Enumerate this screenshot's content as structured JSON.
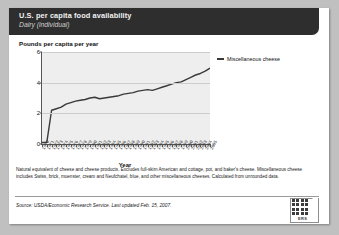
{
  "header": {
    "title": "U.S. per capita food availability",
    "subtitle": "Dairy (individual)"
  },
  "chart_data": {
    "type": "line",
    "title": "U.S. per capita food availability",
    "subtitle": "Dairy (individual)",
    "ylabel": "Pounds per capita per year",
    "xlabel": "Year",
    "ylim": [
      0,
      6
    ],
    "yticks": [
      0,
      2,
      4,
      6
    ],
    "grid": true,
    "legend_position": "right",
    "legend": [
      "Miscellaneous cheese"
    ],
    "categories": [
      "1970",
      "1971",
      "1972",
      "1973",
      "1974",
      "1975",
      "1976",
      "1977",
      "1978",
      "1979",
      "1980",
      "1981",
      "1982",
      "1983",
      "1984",
      "1985",
      "1986",
      "1987",
      "1988",
      "1989",
      "1990",
      "1991",
      "1992",
      "1993",
      "1994",
      "1995",
      "1996",
      "1997",
      "1998",
      "1999",
      "2000",
      "2001",
      "2002",
      "2003",
      "2004",
      "2005"
    ],
    "tick_labels": [
      "1970",
      "1971",
      "1972",
      "1973",
      "1974",
      "1975",
      "1976",
      "1977",
      "1978",
      "1979",
      "1980",
      "1981",
      "1982",
      "1983",
      "1984",
      "1985",
      "1986",
      "1987",
      "1988",
      "1989",
      "1990",
      "1991",
      "1992",
      "1993",
      "1994",
      "1995",
      "1996",
      "1997",
      "1998",
      "1999",
      "2000",
      "2001",
      "2002",
      "2003",
      "2004",
      "2005"
    ],
    "series": [
      {
        "name": "Miscellaneous cheese",
        "color": "#3a3a3a",
        "values": [
          0.1,
          0.1,
          2.2,
          2.3,
          2.4,
          2.6,
          2.7,
          2.8,
          2.85,
          2.9,
          3.0,
          3.05,
          2.95,
          3.0,
          3.05,
          3.1,
          3.15,
          3.25,
          3.3,
          3.35,
          3.45,
          3.5,
          3.55,
          3.5,
          3.6,
          3.7,
          3.8,
          3.9,
          4.0,
          4.05,
          4.2,
          4.35,
          4.5,
          4.6,
          4.75,
          4.95
        ]
      }
    ]
  },
  "footnote": "Natural equivalent of cheese and cheese products.  Excludes full-skim American and cottage, pot, and baker's cheese.  Miscellaneous cheese includes Swiss, brick, muenster, cream and Neufchatel, blue, and other miscellaneous cheeses. Calculated from unrounded data.",
  "source": "Source: USDA/Economic Research Service.  Last updated Feb. 15, 2007.",
  "logo": {
    "wordmark": "ERS",
    "name": "ers-logo"
  }
}
